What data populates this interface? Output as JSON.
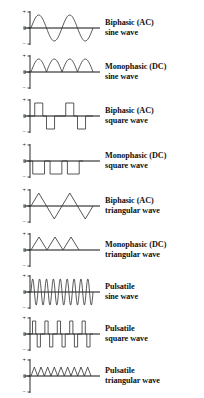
{
  "figure": {
    "axis_labels": {
      "positive": "+",
      "zero": "0",
      "negative": "−"
    },
    "stroke_color": "#3a3a3a",
    "axis_color": "#111111",
    "background": "#ffffff"
  },
  "rows": [
    {
      "id": "biphasic-ac-sine",
      "label_line1": "Biphasic (AC)",
      "label_line2": "sine wave",
      "waveform": "sine",
      "polarity": "biphasic",
      "cycles": 2,
      "amplitude": 1.0
    },
    {
      "id": "monophasic-dc-sine",
      "label_line1": "Monophasic (DC)",
      "label_line2": "sine wave",
      "waveform": "sine",
      "polarity": "monophasic-positive",
      "cycles": 2,
      "amplitude": 1.0
    },
    {
      "id": "biphasic-ac-square",
      "label_line1": "Biphasic (AC)",
      "label_line2": "square wave",
      "waveform": "square",
      "polarity": "biphasic",
      "cycles": 2,
      "amplitude": 1.0
    },
    {
      "id": "monophasic-dc-square",
      "label_line1": "Monophasic (DC)",
      "label_line2": "square wave",
      "waveform": "square",
      "polarity": "monophasic-negative",
      "cycles": 3,
      "amplitude": 1.0
    },
    {
      "id": "biphasic-ac-triangular",
      "label_line1": "Biphasic (AC)",
      "label_line2": "triangular wave",
      "waveform": "triangular",
      "polarity": "biphasic",
      "cycles": 2,
      "amplitude": 1.0
    },
    {
      "id": "monophasic-dc-triangular",
      "label_line1": "Monophasic (DC)",
      "label_line2": "triangular wave",
      "waveform": "triangular",
      "polarity": "monophasic-positive",
      "cycles": 3,
      "amplitude": 1.0
    },
    {
      "id": "pulsatile-sine",
      "label_line1": "Pulsatile",
      "label_line2": "sine wave",
      "waveform": "sine",
      "polarity": "biphasic",
      "cycles": 9,
      "amplitude": 1.0
    },
    {
      "id": "pulsatile-square",
      "label_line1": "Pulsatile",
      "label_line2": "square wave",
      "waveform": "square",
      "polarity": "biphasic",
      "cycles": 5,
      "amplitude": 1.0
    },
    {
      "id": "pulsatile-triangular",
      "label_line1": "Pulsatile",
      "label_line2": "triangular wave",
      "waveform": "triangular",
      "polarity": "monophasic-positive",
      "cycles": 9,
      "amplitude": 1.0
    }
  ]
}
